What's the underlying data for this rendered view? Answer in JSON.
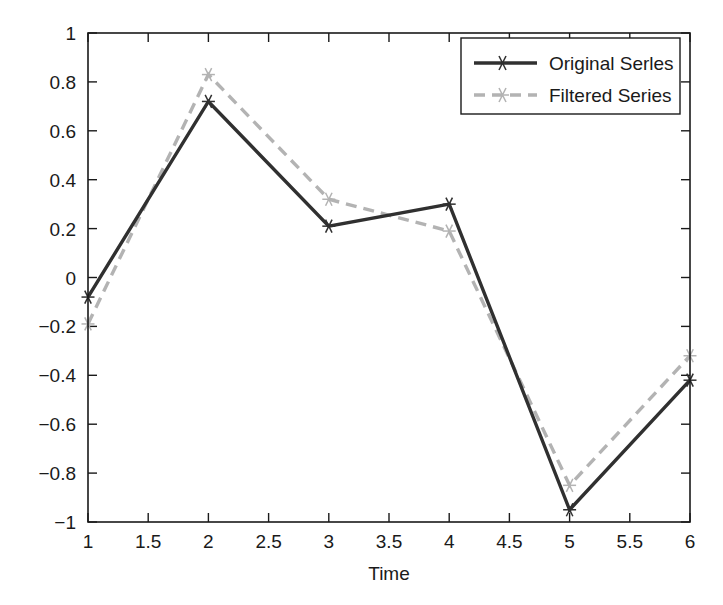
{
  "chart_data": {
    "type": "line",
    "title": "",
    "xlabel": "Time",
    "ylabel": "",
    "xlim": [
      1,
      6
    ],
    "ylim": [
      -1,
      1
    ],
    "grid": false,
    "legend_position": "top-right",
    "x": [
      1,
      2,
      3,
      4,
      5,
      6
    ],
    "xticks": [
      "1",
      "1.5",
      "2",
      "2.5",
      "3",
      "3.5",
      "4",
      "4.5",
      "5",
      "5.5",
      "6"
    ],
    "xtick_values": [
      1,
      1.5,
      2,
      2.5,
      3,
      3.5,
      4,
      4.5,
      5,
      5.5,
      6
    ],
    "yticks": [
      "1",
      "0.8",
      "0.6",
      "0.4",
      "0.2",
      "0",
      "-0.2",
      "-0.4",
      "-0.6",
      "-0.8",
      "-1"
    ],
    "ytick_values": [
      1,
      0.8,
      0.6,
      0.4,
      0.2,
      0,
      -0.2,
      -0.4,
      -0.6,
      -0.8,
      -1
    ],
    "series": [
      {
        "name": "Original Serles",
        "values": [
          -0.08,
          0.72,
          0.21,
          0.3,
          -0.95,
          -0.42
        ],
        "color": "#303030",
        "style": "solid",
        "marker": "star"
      },
      {
        "name": "Filtered Series",
        "values": [
          -0.19,
          0.83,
          0.32,
          0.19,
          -0.85,
          -0.32
        ],
        "color": "#b3b3b3",
        "style": "dashed",
        "marker": "star"
      }
    ]
  },
  "axis": {
    "xlabel": "Time"
  },
  "legend": {
    "entries": [
      {
        "label": "Original Serles"
      },
      {
        "label": "Filtered Series"
      }
    ]
  },
  "colors": {
    "original": "#303030",
    "filtered": "#b3b3b3",
    "axis": "#1a1a1a",
    "background": "#ffffff"
  }
}
